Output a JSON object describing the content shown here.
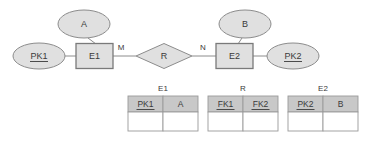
{
  "diagram": {
    "entities": [
      {
        "id": "E1",
        "label": "E1",
        "type": "entity",
        "x": 94.5,
        "y": 56,
        "w": 38,
        "h": 25
      },
      {
        "id": "E2",
        "label": "E2",
        "type": "entity",
        "x": 234.5,
        "y": 56,
        "w": 38,
        "h": 25
      }
    ],
    "attributes": [
      {
        "id": "A",
        "label": "A",
        "key": false,
        "x": 84,
        "y": 24,
        "rx": 26,
        "ry": 14
      },
      {
        "id": "PK1",
        "label": "PK1",
        "key": true,
        "x": 39,
        "y": 56,
        "rx": 26,
        "ry": 13
      },
      {
        "id": "B",
        "label": "B",
        "key": false,
        "x": 245,
        "y": 24,
        "rx": 26,
        "ry": 14
      },
      {
        "id": "PK2",
        "label": "PK2",
        "key": true,
        "x": 293,
        "y": 56,
        "rx": 26,
        "ry": 13
      }
    ],
    "relationship": {
      "id": "R",
      "label": "R",
      "x": 164,
      "y": 56,
      "w": 56,
      "h": 25
    },
    "cardinality": [
      {
        "label": "M",
        "x": 121,
        "y": 48
      },
      {
        "label": "N",
        "x": 203,
        "y": 48
      }
    ]
  },
  "tables": [
    {
      "name": "E1",
      "title_x": 163,
      "x": 128,
      "y": 96,
      "col_w": 35,
      "hdr_h": 16,
      "row_h": 19,
      "columns": [
        {
          "label": "PK1",
          "underlined": true
        },
        {
          "label": "A",
          "underlined": false
        }
      ]
    },
    {
      "name": "R",
      "title_x": 243,
      "x": 208,
      "y": 96,
      "col_w": 35,
      "hdr_h": 16,
      "row_h": 19,
      "columns": [
        {
          "label": "FK1",
          "underlined": true
        },
        {
          "label": "FK2",
          "underlined": true
        }
      ]
    },
    {
      "name": "E2",
      "title_x": 323,
      "x": 288,
      "y": 96,
      "col_w": 35,
      "hdr_h": 16,
      "row_h": 19,
      "columns": [
        {
          "label": "PK2",
          "underlined": true
        },
        {
          "label": "B",
          "underlined": false
        }
      ]
    }
  ],
  "colors": {
    "shape_fill": "#e0e0e0",
    "shape_stroke": "#8c8c8c",
    "header_fill": "#c8c8c8",
    "cell_stroke": "#9a9a9a",
    "text": "#3a3a3a",
    "background": "#ffffff"
  }
}
